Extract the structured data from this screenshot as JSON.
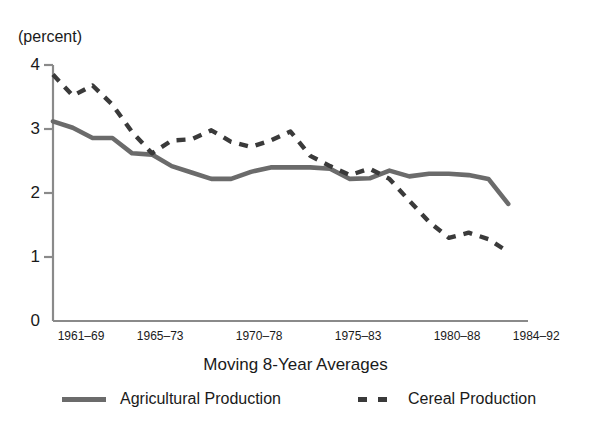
{
  "chart_data": {
    "type": "line",
    "title": "",
    "xlabel": "Moving 8-Year Averages",
    "ylabel": "(percent)",
    "ylim": [
      0,
      4
    ],
    "yticks": [
      0,
      1,
      2,
      3,
      4
    ],
    "ytick_labels": [
      "0",
      "1",
      "2",
      "3",
      "4"
    ],
    "xtick_labels": [
      "1961–69",
      "1965–73",
      "1970–78",
      "1975–83",
      "1980–88",
      "1984–92"
    ],
    "xtick_positions": [
      0,
      4,
      9,
      14,
      19,
      23
    ],
    "xlim": [
      0,
      24
    ],
    "grid": false,
    "legend_position": "bottom",
    "series": [
      {
        "name": "Agricultural Production",
        "style": "solid",
        "color": "#6b6b6b",
        "x": [
          0,
          1,
          2,
          3,
          4,
          5,
          6,
          7,
          8,
          9,
          10,
          11,
          12,
          13,
          14,
          15,
          16,
          17,
          18,
          19,
          20,
          21,
          22,
          23
        ],
        "values": [
          3.12,
          3.02,
          2.86,
          2.86,
          2.62,
          2.6,
          2.42,
          2.32,
          2.22,
          2.22,
          2.33,
          2.4,
          2.4,
          2.4,
          2.38,
          2.22,
          2.23,
          2.35,
          2.26,
          2.3,
          2.3,
          2.28,
          2.22,
          1.83
        ]
      },
      {
        "name": "Cereal Production",
        "style": "dashed",
        "color": "#3a3a3a",
        "x": [
          0,
          1,
          2,
          3,
          4,
          5,
          6,
          7,
          8,
          9,
          10,
          11,
          12,
          13,
          14,
          15,
          16,
          17,
          18,
          19,
          20,
          21,
          22,
          23
        ],
        "values": [
          3.85,
          3.52,
          3.68,
          3.38,
          2.95,
          2.62,
          2.82,
          2.84,
          2.98,
          2.8,
          2.72,
          2.82,
          2.96,
          2.58,
          2.42,
          2.28,
          2.38,
          2.22,
          1.88,
          1.55,
          1.3,
          1.38,
          1.28,
          1.08
        ]
      }
    ]
  },
  "axis": {
    "unit_label": "(percent)"
  },
  "legend": {
    "entries": [
      {
        "label": "Agricultural Production",
        "marker": "solid-line-swatch"
      },
      {
        "label": "Cereal Production",
        "marker": "dashed-line-swatch"
      }
    ]
  }
}
